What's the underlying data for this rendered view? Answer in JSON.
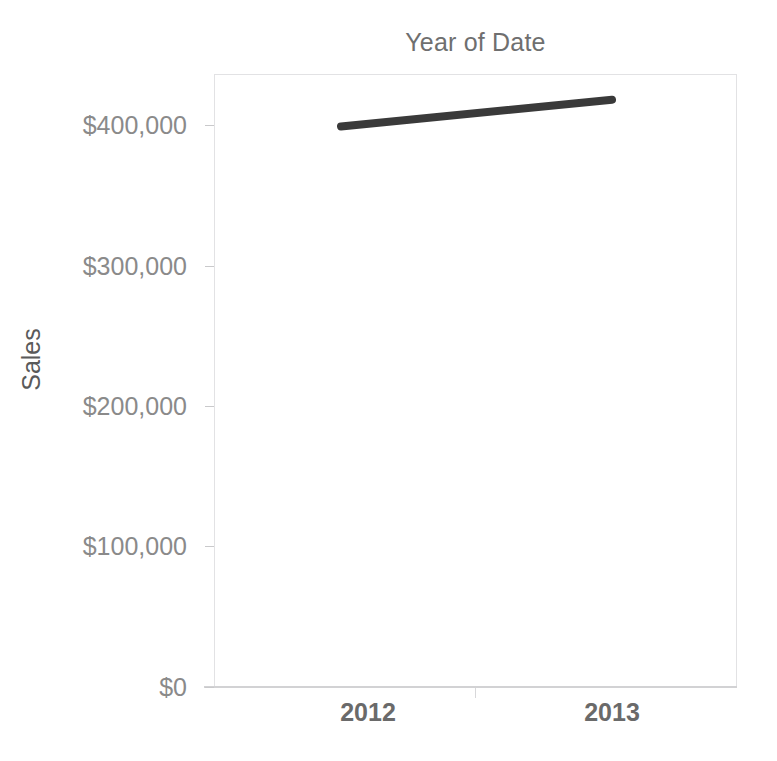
{
  "chart_data": {
    "type": "line",
    "title": "Year of Date",
    "xlabel": "",
    "ylabel": "Sales",
    "categories": [
      "2012",
      "2013"
    ],
    "x": [
      2012,
      2013
    ],
    "series": [
      {
        "name": "Sales",
        "values": [
          399000,
          418000
        ]
      }
    ],
    "ylim": [
      0,
      436000
    ],
    "y_ticks": [
      0,
      100000,
      200000,
      300000,
      400000
    ],
    "y_tick_labels": [
      "$0",
      "$100,000",
      "$200,000",
      "$300,000",
      "$400,000"
    ],
    "x_tick_labels": [
      "2012",
      "2013"
    ],
    "grid": false,
    "legend": false,
    "legend_position": "none",
    "line_color": "#3a3a3a",
    "line_width_px": 8,
    "axis_label_color": "#8a8a8a",
    "title_color": "#6f6f6f",
    "plot_background": "#ffffff",
    "plot_border_color": "#e2e2e4"
  },
  "axis": {
    "y_labels": {
      "t0": "$0",
      "t1": "$100,000",
      "t2": "$200,000",
      "t3": "$300,000",
      "t4": "$400,000"
    },
    "x_labels": {
      "c0": "2012",
      "c1": "2013"
    }
  }
}
